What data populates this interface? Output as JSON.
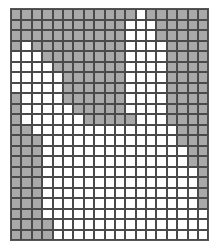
{
  "grid": {
    "columns": 19,
    "rows": 22,
    "colors": {
      "filled": "#a9a9a9",
      "empty": "#ffffff",
      "line": "#4a4a4a"
    },
    "cells": [
      "1111111111110111111",
      "1111111111100011111",
      "1111111111100011111",
      "1011111111100001111",
      "0001111111100001111",
      "0000111111100001111",
      "0000011111100001111",
      "0000011111100001111",
      "1000011111100001111",
      "1000001111100001111",
      "1000000111110001111",
      "1100000000000000111",
      "1110000000000000111",
      "1110000000000000011",
      "1110000000000000011",
      "1110000000000000001",
      "1110000000000000001",
      "1110000000000000001",
      "1110000000000000001",
      "1110000000000000000",
      "1111000000000000000",
      "1111000000000000000"
    ]
  }
}
